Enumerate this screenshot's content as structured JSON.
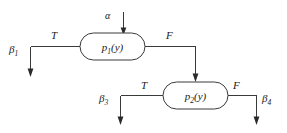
{
  "diagram": {
    "type": "predicate-decision-flow",
    "background_color": "#ffffff",
    "line_color": "#3a3a3a",
    "text_color": "#1a1a1a",
    "input": {
      "label": "α",
      "name": "alpha-input"
    },
    "nodes": [
      {
        "id": "p1",
        "base": "p",
        "subscript": "1",
        "argument": "(y)",
        "full_label": "p₁(y)"
      },
      {
        "id": "p2",
        "base": "p",
        "subscript": "2",
        "argument": "(y)",
        "full_label": "p₂(y)"
      }
    ],
    "edge_labels": {
      "p1_true": "T",
      "p1_false": "F",
      "p2_true": "T",
      "p2_false": "F"
    },
    "terminals": [
      {
        "id": "b1",
        "base": "β",
        "subscript": "1",
        "full_label": "β₁"
      },
      {
        "id": "b3",
        "base": "β",
        "subscript": "3",
        "full_label": "β₃"
      },
      {
        "id": "b4",
        "base": "β",
        "subscript": "4",
        "full_label": "β₄"
      }
    ]
  }
}
